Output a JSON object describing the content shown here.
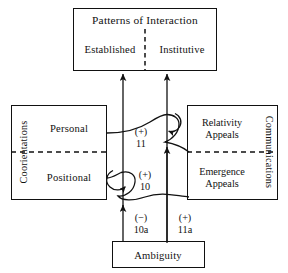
{
  "diagram": {
    "title_hidden": "Patterns of Interaction model",
    "boxes": {
      "patterns": {
        "title": "Patterns of Interaction",
        "left_cell": "Established",
        "right_cell": "Institutive"
      },
      "coorientations": {
        "side_label": "Coorientations",
        "top_cell": "Personal",
        "bottom_cell": "Positional"
      },
      "communications": {
        "side_label": "Communications",
        "top_cell_line1": "Relativity",
        "top_cell_line2": "Appeals",
        "bottom_cell_line1": "Emergence",
        "bottom_cell_line2": "Appeals"
      },
      "ambiguity": {
        "label": "Ambiguity"
      }
    },
    "annotations": [
      {
        "name": "link-11",
        "sign": "(+)",
        "number": "11"
      },
      {
        "name": "link-10",
        "sign": "(+)",
        "number": "10"
      },
      {
        "name": "link-10a",
        "sign": "(−)",
        "number": "10a"
      },
      {
        "name": "link-11a",
        "sign": "(+)",
        "number": "11a"
      }
    ],
    "colors": {
      "stroke": "#111111",
      "background": "#ffffff"
    }
  }
}
